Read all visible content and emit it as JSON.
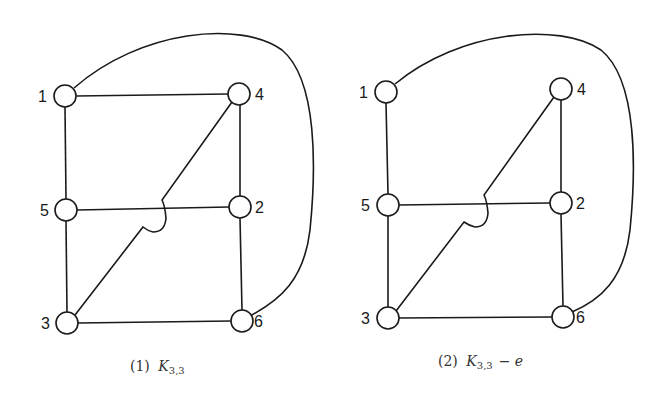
{
  "figures": [
    {
      "caption_number": "(1)",
      "caption_math": "K",
      "caption_sub": "3,3",
      "caption_suffix": "",
      "nodes": [
        {
          "id": "1",
          "x": 65,
          "y": 96
        },
        {
          "id": "4",
          "x": 239,
          "y": 94
        },
        {
          "id": "5",
          "x": 66,
          "y": 210
        },
        {
          "id": "2",
          "x": 240,
          "y": 207
        },
        {
          "id": "3",
          "x": 67,
          "y": 323
        },
        {
          "id": "6",
          "x": 242,
          "y": 321
        }
      ],
      "edges": [
        [
          "1",
          "4"
        ],
        [
          "1",
          "5"
        ],
        [
          "5",
          "3"
        ],
        [
          "4",
          "2"
        ],
        [
          "2",
          "6"
        ],
        [
          "3",
          "6"
        ],
        [
          "5",
          "2"
        ],
        [
          "3",
          "4"
        ],
        [
          "1",
          "6"
        ]
      ]
    },
    {
      "caption_number": "(2)",
      "caption_math": "K",
      "caption_sub": "3,3",
      "caption_suffix": "− e",
      "nodes": [
        {
          "id": "1",
          "x": 386,
          "y": 92
        },
        {
          "id": "4",
          "x": 561,
          "y": 89
        },
        {
          "id": "5",
          "x": 388,
          "y": 205
        },
        {
          "id": "2",
          "x": 561,
          "y": 203
        },
        {
          "id": "3",
          "x": 388,
          "y": 318
        },
        {
          "id": "6",
          "x": 563,
          "y": 317
        }
      ],
      "edges": [
        [
          "1",
          "5"
        ],
        [
          "5",
          "3"
        ],
        [
          "4",
          "2"
        ],
        [
          "2",
          "6"
        ],
        [
          "3",
          "6"
        ],
        [
          "5",
          "2"
        ],
        [
          "3",
          "4"
        ],
        [
          "1",
          "6"
        ]
      ]
    }
  ]
}
